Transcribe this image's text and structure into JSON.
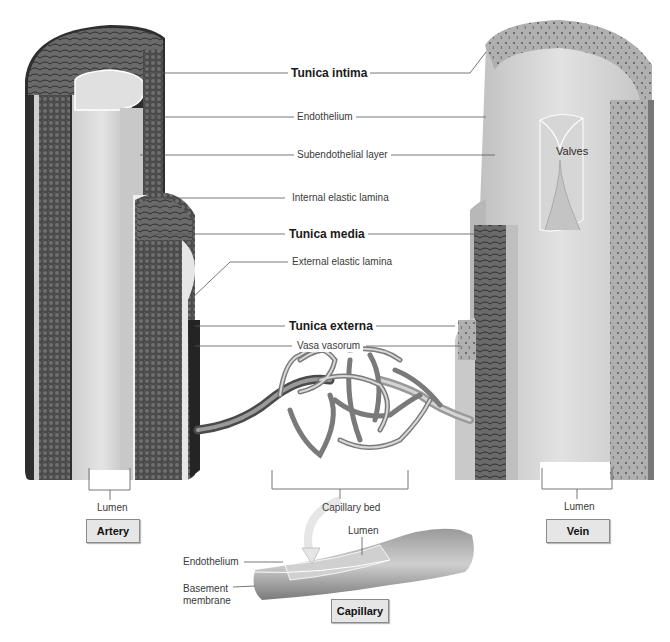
{
  "figure": {
    "vessels": {
      "artery": {
        "label": "Artery",
        "lumen_label": "Lumen"
      },
      "vein": {
        "label": "Vein",
        "lumen_label": "Lumen",
        "valves_label": "Valves"
      },
      "capillary": {
        "label": "Capillary",
        "lumen_label": "Lumen",
        "endothelium_label": "Endothelium",
        "basement_membrane_label_line1": "Basement",
        "basement_membrane_label_line2": "membrane"
      }
    },
    "layer_labels": {
      "tunica_intima": "Tunica intima",
      "endothelium": "Endothelium",
      "subendothelial_layer": "Subendothelial layer",
      "internal_elastic_lamina": "Internal elastic lamina",
      "tunica_media": "Tunica media",
      "external_elastic_lamina": "External elastic lamina",
      "tunica_externa": "Tunica externa",
      "vasa_vasorum": "Vasa vasorum"
    },
    "capillary_bed_label": "Capillary bed",
    "colors": {
      "background": "#ffffff",
      "leader_line": "#555555",
      "label_box_fill": "#e6e6e6",
      "tissue_dark": "#3c3c3c",
      "tissue_mid": "#8c8c8c",
      "tissue_light": "#d4d4d4"
    }
  }
}
